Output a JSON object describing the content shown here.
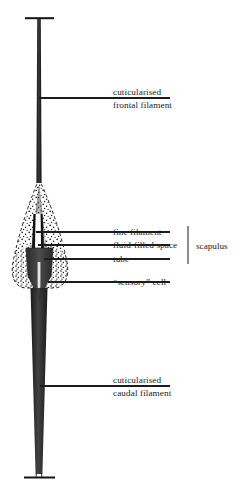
{
  "figure": {
    "title_visible": false,
    "background_color": "#ffffff",
    "ink_color": "#1c1c1c",
    "labels": [
      {
        "id": "cuticularised-frontal-filament",
        "lines": [
          "cuticularised",
          "frontal filament"
        ],
        "leader_y": 98,
        "text_x": 113,
        "text_y": 102
      },
      {
        "id": "fine-filament",
        "lines": [
          "fine filament"
        ],
        "leader_y": 232,
        "text_x": 113,
        "text_y": 235
      },
      {
        "id": "fluid-filled-space",
        "lines": [
          "fluid-filled space"
        ],
        "leader_y": 245,
        "text_x": 113,
        "text_y": 248
      },
      {
        "id": "tube",
        "lines": [
          "tube"
        ],
        "leader_y": 259,
        "text_x": 113,
        "text_y": 262
      },
      {
        "id": "sensory-cell",
        "lines": [
          "“sensory” cell"
        ],
        "leader_y": 282,
        "text_x": 113,
        "text_y": 285
      },
      {
        "id": "cuticularised-caudal-filament",
        "lines": [
          "cuticularised",
          "caudal filament"
        ],
        "leader_y": 386,
        "text_x": 113,
        "text_y": 390
      }
    ],
    "bracket": {
      "id": "scapulus-bracket",
      "label": "scapulus",
      "x": 188,
      "y_top": 226,
      "y_bottom": 264,
      "text_x": 196,
      "text_y": 249
    },
    "anatomy": {
      "frontal_filament": {
        "name": "cuticularised frontal filament",
        "cap_label": "terminal cap",
        "stem_x": 39,
        "top_y": 18,
        "bottom_y": 186
      },
      "caudal_filament": {
        "name": "cuticularised caudal filament",
        "top_y": 290,
        "bottom_y": 476
      },
      "scapulus_region": {
        "name": "scapulus",
        "outline_style": "dashed",
        "fill_style": "stippled",
        "top_y": 178,
        "bottom_y": 288
      }
    }
  }
}
